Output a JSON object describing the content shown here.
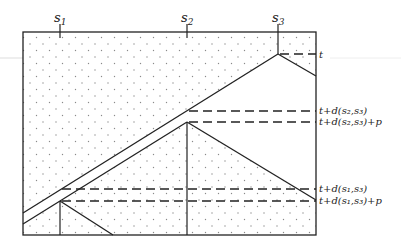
{
  "diagram": {
    "sites": [
      {
        "id": "s1",
        "label": "s",
        "sub": "1",
        "x": 60
      },
      {
        "id": "s2",
        "label": "s",
        "sub": "2",
        "x": 187
      },
      {
        "id": "s3",
        "label": "s",
        "sub": "3",
        "x": 278
      }
    ],
    "time_labels": [
      {
        "id": "t",
        "text": "t",
        "y": 54
      },
      {
        "id": "t-d-s2-s3",
        "text": "t+d(s₂,s₃)",
        "y": 111
      },
      {
        "id": "t-d-s2-s3-p",
        "text": "t+d(s₂,s₃)+p",
        "y": 122
      },
      {
        "id": "t-d-s1-s3",
        "text": "t+d(s₁,s₃)",
        "y": 189
      },
      {
        "id": "t-d-s1-s3-p",
        "text": "t+d(s₁,s₃)+p",
        "y": 201
      }
    ],
    "colors": {
      "line": "#222222",
      "dots": "#8a8a8a",
      "artifact": "#dddddd"
    }
  }
}
